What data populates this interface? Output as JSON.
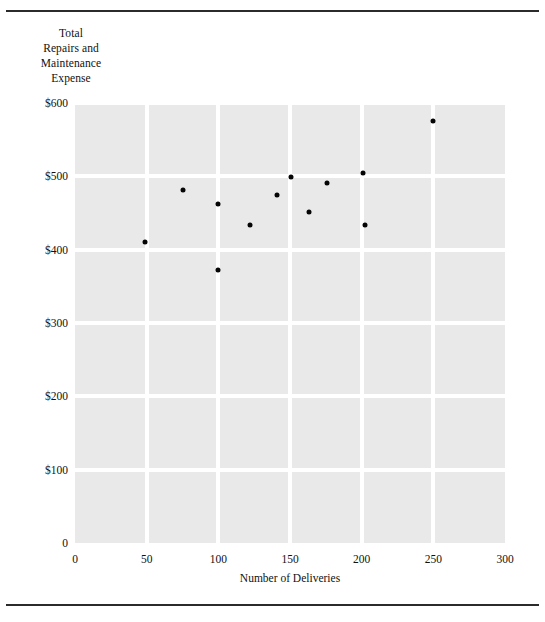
{
  "figure": {
    "y_axis_title_lines": [
      "Total",
      "Repairs and",
      "Maintenance",
      "Expense"
    ],
    "x_axis_title": "Number of Deliveries",
    "point_color": "#050505",
    "plot_background": "#e9e9e9",
    "grid_color": "#ffffff",
    "rule_color": "#2b2b2b"
  },
  "chart_data": {
    "type": "scatter",
    "title": "",
    "xlabel": "Number of Deliveries",
    "ylabel": "Total Repairs and Maintenance Expense",
    "xlim": [
      0,
      300
    ],
    "ylim": [
      0,
      600
    ],
    "xticks": [
      0,
      50,
      100,
      150,
      200,
      250,
      300
    ],
    "xtick_labels": [
      "0",
      "50",
      "100",
      "150",
      "200",
      "250",
      "300"
    ],
    "yticks": [
      0,
      100,
      200,
      300,
      400,
      500,
      600
    ],
    "ytick_labels": [
      "0",
      "$100",
      "$200",
      "$300",
      "$400",
      "$500",
      "$600"
    ],
    "grid": true,
    "legend": null,
    "x": [
      49,
      75,
      100,
      100,
      122,
      141,
      151,
      163,
      176,
      201,
      202,
      250
    ],
    "y": [
      410,
      481,
      462,
      372,
      433,
      475,
      499,
      452,
      491,
      504,
      433,
      576
    ],
    "points": [
      {
        "x": 49,
        "y": 410
      },
      {
        "x": 75,
        "y": 481
      },
      {
        "x": 100,
        "y": 462
      },
      {
        "x": 100,
        "y": 372
      },
      {
        "x": 122,
        "y": 433
      },
      {
        "x": 141,
        "y": 475
      },
      {
        "x": 151,
        "y": 499
      },
      {
        "x": 163,
        "y": 452
      },
      {
        "x": 176,
        "y": 491
      },
      {
        "x": 201,
        "y": 504
      },
      {
        "x": 202,
        "y": 433
      },
      {
        "x": 250,
        "y": 576
      }
    ]
  }
}
